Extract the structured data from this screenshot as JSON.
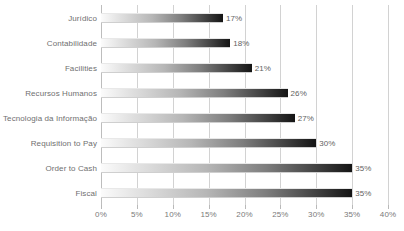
{
  "chart_data": {
    "type": "bar",
    "orientation": "horizontal",
    "title": "",
    "subtitle": "",
    "xlabel": "",
    "ylabel": "",
    "xlim": [
      0,
      40
    ],
    "xtick_labels": [
      "0%",
      "5%",
      "10%",
      "15%",
      "20%",
      "25%",
      "30%",
      "35%",
      "40%"
    ],
    "xtick_values": [
      0,
      5,
      10,
      15,
      20,
      25,
      30,
      35,
      40
    ],
    "grid": "vertical",
    "legend": "none",
    "categories": [
      "Jurídico",
      "Contabilidade",
      "Facilities",
      "Recursos Humanos",
      "Tecnologia da Informação",
      "Requisition to Pay",
      "Order to Cash",
      "Fiscal"
    ],
    "values": [
      17,
      18,
      21,
      26,
      27,
      30,
      35,
      35
    ],
    "data_labels": [
      "17%",
      "18%",
      "21%",
      "26%",
      "27%",
      "30%",
      "35%",
      "35%"
    ],
    "colors": {
      "bar_gradient_start": "#fbfbfb",
      "bar_gradient_end": "#141414",
      "gridline": "#d2d2d2",
      "axis": "#bdbdbd",
      "text": "#6f6f6f",
      "background": "#ffffff"
    }
  }
}
